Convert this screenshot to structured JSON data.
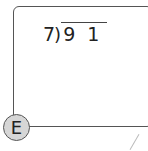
{
  "problem": {
    "divisor": "7",
    "bracket": ")",
    "dividend": "9 1"
  },
  "label": "E"
}
